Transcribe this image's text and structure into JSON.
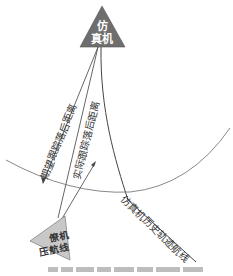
{
  "diagram": {
    "nodes": {
      "simulator": {
        "label_line1": "仿",
        "label_line2": "真机",
        "fill": "#707070",
        "text_color": "#ffffff"
      },
      "wingman": {
        "label_line1": "僚机",
        "label_line2": "压航线",
        "fill": "#c8c8c8",
        "text_color": "#333333"
      }
    },
    "edges": {
      "expected_distance": {
        "label": "期望跟踪落后距离"
      },
      "actual_distance": {
        "label": "实际跟踪落后距离"
      },
      "history_track": {
        "label": "仿真机历史轨迹航线"
      }
    },
    "colors": {
      "line": "#555555",
      "arc": "#777777",
      "background": "#ffffff"
    }
  }
}
